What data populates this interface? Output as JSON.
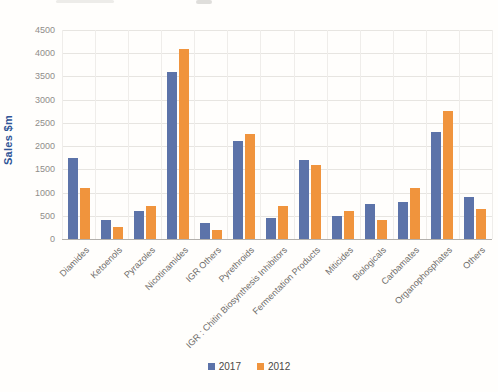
{
  "chart_data": {
    "type": "bar",
    "title": "",
    "xlabel": "",
    "ylabel": "Sales $m",
    "ylim": [
      0,
      4500
    ],
    "ytick_step": 500,
    "grid": true,
    "legend_position": "bottom",
    "categories": [
      "Diamides",
      "Ketoenols",
      "Pyrazoles",
      "Nicotinamides",
      "IGR Others",
      "Pyrethroids",
      "IGR : Chitin Biosynthesis Inhibitors",
      "Fermentation Products",
      "Miticides",
      "Biologicals",
      "Carbamates",
      "Organophosphates",
      "Others"
    ],
    "series": [
      {
        "name": "2017",
        "color": "#5c73a9",
        "values": [
          1750,
          400,
          600,
          3600,
          350,
          2100,
          450,
          1700,
          500,
          750,
          800,
          2300,
          900
        ]
      },
      {
        "name": "2012",
        "color": "#f0943d",
        "values": [
          1100,
          250,
          700,
          4100,
          200,
          2250,
          700,
          1600,
          600,
          400,
          1100,
          2750,
          650
        ]
      }
    ]
  },
  "colors": {
    "axis_title": "#2f5597",
    "tick_label": "#8f8d8a",
    "category_label": "#6f6d6a",
    "gridline": "#e7e5e1",
    "axis_line": "#b3b0ac"
  }
}
